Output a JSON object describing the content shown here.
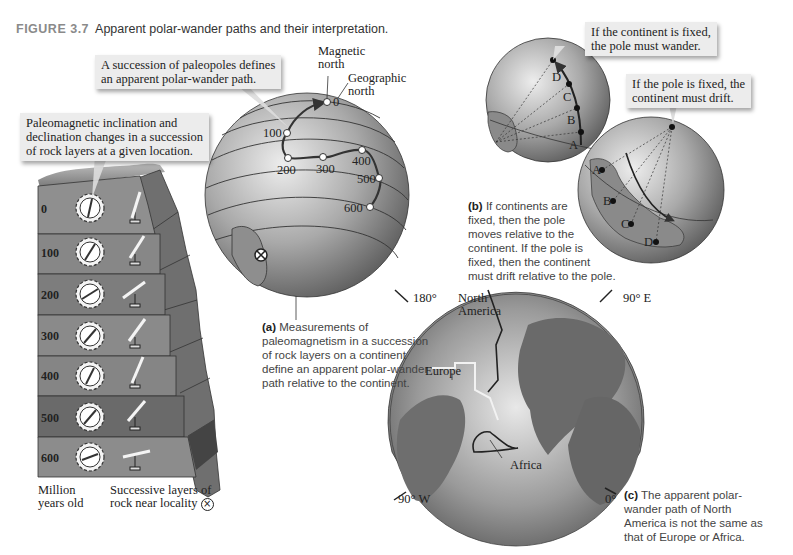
{
  "figure": {
    "number": "FIGURE 3.7",
    "title": "Apparent polar-wander paths and their interpretation."
  },
  "panel_a": {
    "callout_path": "A succession of paleopoles defines an apparent polar-wander path.",
    "callout_path_lines": [
      "A succession of paleopoles defines",
      "an apparent polar-wander path."
    ],
    "callout_layers_lines": [
      "Paleomagnetic inclination and",
      "declination changes in a succession",
      "of rock layers at a given location."
    ],
    "magnetic_north": [
      "Magnetic",
      "north"
    ],
    "geographic_north": [
      "Geographic",
      "north"
    ],
    "path_points": [
      {
        "label": "0",
        "x": 327,
        "y": 102
      },
      {
        "label": "100",
        "x": 287,
        "y": 133
      },
      {
        "label": "200",
        "x": 288,
        "y": 158
      },
      {
        "label": "300",
        "x": 323,
        "y": 157
      },
      {
        "label": "400",
        "x": 362,
        "y": 150
      },
      {
        "label": "500",
        "x": 379,
        "y": 178
      },
      {
        "label": "600",
        "x": 370,
        "y": 207
      }
    ],
    "layers": [
      {
        "age": "0",
        "color": "#8f8f8f"
      },
      {
        "age": "100",
        "color": "#878787"
      },
      {
        "age": "200",
        "color": "#7d7d7d"
      },
      {
        "age": "300",
        "color": "#8a8a8a"
      },
      {
        "age": "400",
        "color": "#858585"
      },
      {
        "age": "500",
        "color": "#6a6a6a"
      },
      {
        "age": "600",
        "color": "#8c8c8c"
      }
    ],
    "axis_label_lines": [
      "Million",
      "years old"
    ],
    "locality_label_lines": [
      "Successive layers of",
      "rock near locality"
    ],
    "caption_bold": "(a)",
    "caption_lines": [
      " Measurements of",
      "paleomagnetism in a succession",
      "of rock layers on a continent",
      "define an apparent polar-wander",
      "path relative to the continent."
    ]
  },
  "panel_b": {
    "callout_continent_fixed": [
      "If the continent is fixed,",
      "the pole must wander."
    ],
    "callout_pole_fixed": [
      "If the pole is fixed, the",
      "continent must drift."
    ],
    "pole_labels": [
      "A",
      "B",
      "C",
      "D"
    ],
    "continent_labels": [
      "A",
      "B",
      "C",
      "D"
    ],
    "caption_bold": "(b)",
    "caption_lines": [
      " If continents are",
      "fixed, then the pole",
      "moves relative to the",
      "continent. If the pole is",
      "fixed, then the continent",
      "must drift relative to the pole."
    ]
  },
  "panel_c": {
    "lon_180": "180°",
    "lon_90e": "90° E",
    "lon_90w": "90° W",
    "lon_0": "0°",
    "north_america": [
      "North",
      "America"
    ],
    "europe": "Europe",
    "africa": "Africa",
    "caption_bold": "(c)",
    "caption_lines": [
      " The apparent polar-",
      "wander path of North",
      "America is not the same as",
      "that of Europe or Africa."
    ]
  },
  "colors": {
    "globe_light": "#e6e6e6",
    "globe_dark": "#6e6e6e",
    "callout_bg": "#ececec",
    "path": "#333333"
  }
}
